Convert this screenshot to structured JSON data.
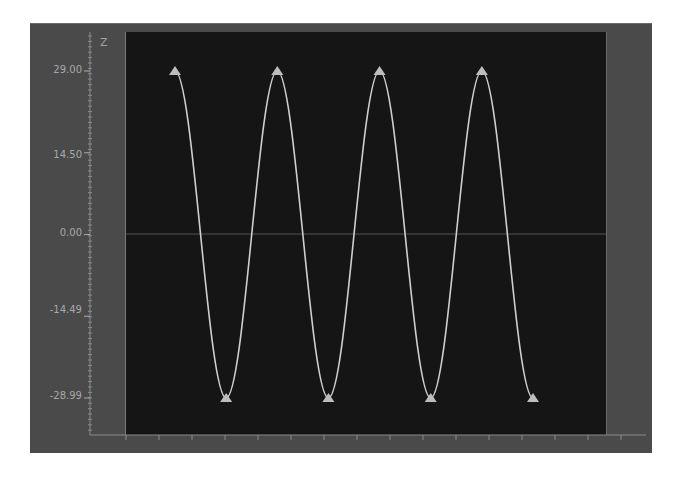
{
  "chart_data": {
    "type": "line",
    "title": "",
    "xlabel": "",
    "ylabel": "Z",
    "ylim": [
      -28.99,
      29.0
    ],
    "y_ticks": [
      "29.00",
      "14.50",
      "0.00",
      "-14.49",
      "-28.99"
    ],
    "y_tick_values": [
      29.0,
      14.5,
      0.0,
      -14.49,
      -28.99
    ],
    "grid": false,
    "zero_line": true,
    "legend": null,
    "x_tick_labels": [],
    "series": [
      {
        "name": "Z",
        "shape": "sinusoid",
        "cycles": 3.5,
        "amplitude": 29.0,
        "keyframes": [
          {
            "type": "peak",
            "value": 29.0
          },
          {
            "type": "trough",
            "value": -28.99
          },
          {
            "type": "peak",
            "value": 29.0
          },
          {
            "type": "trough",
            "value": -28.99
          },
          {
            "type": "peak",
            "value": 29.0
          },
          {
            "type": "trough",
            "value": -28.99
          },
          {
            "type": "peak",
            "value": 29.0
          },
          {
            "type": "trough",
            "value": -28.99
          }
        ]
      }
    ]
  },
  "axis": {
    "y_name": "Z",
    "y_labels": [
      "29.00",
      "14.50",
      "0.00",
      "-14.49",
      "-28.99"
    ]
  },
  "colors": {
    "frame": "#4a4a4a",
    "plot_background": "#151515",
    "curve": "#cfcfcf",
    "keyframe_marker": "#bdbdbd",
    "zero_line": "#555555",
    "ruler": "#8a8a8a",
    "label_text": "#a8a8a8"
  }
}
